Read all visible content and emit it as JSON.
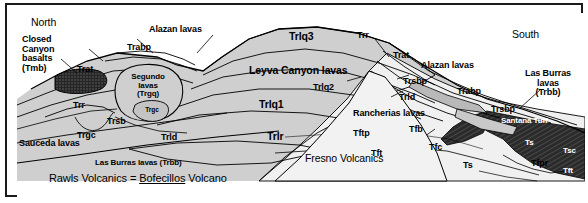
{
  "figure": {
    "type": "geologic-cross-section",
    "orientation_labels": {
      "left": "North",
      "right": "South"
    },
    "caption": {
      "prefix": "Rawls Volcanics = ",
      "underlined": "Bofecillos",
      "suffix": " Volcano"
    }
  },
  "colors": {
    "frame": "#1a1a1a",
    "page": "#ffffff",
    "rock_light": "#d8d8d8",
    "rock_mid": "#b4b4b4",
    "rock_dark": "#2b2b2b",
    "fresno_fill": "#efefef",
    "line": "#000000"
  },
  "labels": {
    "north": "North",
    "south": "South",
    "closed_canyon": "Closed\nCanyon\nbasalts\n(Tmb)",
    "trat_left": "Trat",
    "trabp_left": "Trabp",
    "alazan_left": "Alazan lavas",
    "segundo": "Segundo\nlavas\n(Trgq)",
    "trgc_inner": "Trgc",
    "trr_left": "Trr",
    "trsb": "Trsb",
    "trgc": "Trgc",
    "sauceda": "Sauceda lavas",
    "trld_left": "Trld",
    "las_burras_center": "Las Burras lavas (Trbb)",
    "trlq3": "Trlq3",
    "leyva": "Leyva Canyon lavas",
    "trlq2": "Trlq2",
    "trlq1": "Trlq1",
    "trlr": "Trlr",
    "trr_right": "Trr",
    "trat_right": "Trat",
    "alazan_right": "Alazan lavas",
    "trsbp_upper": "Trsbp",
    "trabp_right": "Trabp",
    "trsbp_lower": "Trsbp",
    "trld_right": "Trld",
    "rancherias": "Rancherias lavas",
    "las_burras_right": "Las Burras\nlavas\n(Trbb)",
    "fresno": "Fresno Volcanics",
    "tftp": "Tftp",
    "tfb": "Tfb",
    "tfc": "Tfc",
    "tft_left": "Tft",
    "ts_mid": "Ts",
    "santana": "Santana Tuff",
    "ts_right": "Ts",
    "tsc": "Tsc",
    "tfpr": "Tfpr",
    "tft_right": "Tft"
  }
}
